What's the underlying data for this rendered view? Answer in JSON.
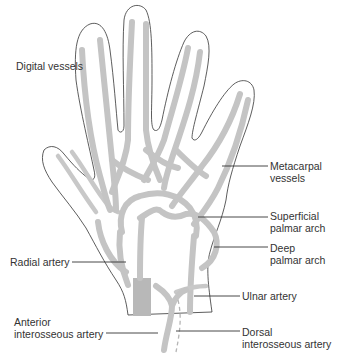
{
  "figure": {
    "colors": {
      "outline": "#333333",
      "vessel": "#c4c4c4",
      "label_text": "#333333",
      "background": "#ffffff"
    }
  },
  "labels": {
    "digital_vessels": "Digital vessels",
    "metacarpal_line1": "Metacarpal",
    "metacarpal_line2": "vessels",
    "superficial_line1": "Superficial",
    "superficial_line2": "palmar arch",
    "deep_line1": "Deep",
    "deep_line2": "palmar arch",
    "radial_artery": "Radial artery",
    "ulnar_artery": "Ulnar artery",
    "anterior_line1": "Anterior",
    "anterior_line2": "interosseous artery",
    "dorsal_line1": "Dorsal",
    "dorsal_line2": "interosseous artery"
  }
}
